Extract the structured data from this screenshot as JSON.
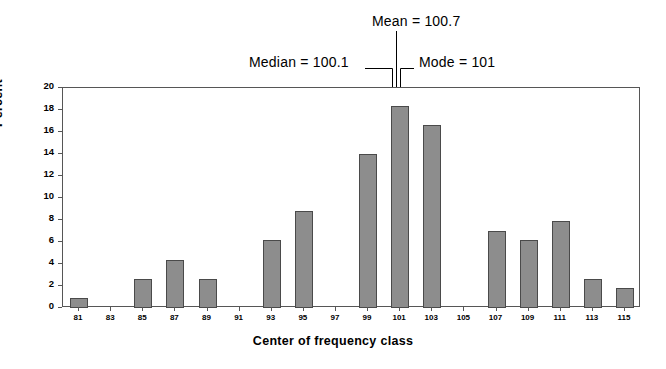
{
  "chart_data": {
    "type": "bar",
    "title": "",
    "subtitle": "",
    "xlabel": "Center of frequency class",
    "ylabel": "Percent",
    "categories": [
      81,
      82,
      83,
      84,
      85,
      86,
      87,
      88,
      89,
      90,
      91,
      92,
      93,
      94,
      95,
      96,
      97,
      98,
      99,
      100,
      101,
      102,
      103,
      104,
      105,
      106,
      107,
      108,
      109,
      110,
      111,
      112,
      113,
      114,
      115
    ],
    "values": [
      0.9,
      0,
      0,
      0,
      2.6,
      0,
      4.4,
      0,
      2.6,
      0,
      0,
      0,
      6.2,
      0,
      8.8,
      0,
      0,
      0,
      14.0,
      0,
      18.4,
      0,
      16.6,
      0,
      0,
      0,
      7.0,
      0,
      6.2,
      0,
      7.9,
      0,
      2.6,
      0,
      1.8
    ],
    "xlim": [
      80,
      116
    ],
    "ylim": [
      0,
      20
    ],
    "ytick_values": [
      0,
      2,
      4,
      6,
      8,
      10,
      12,
      14,
      16,
      18,
      20
    ],
    "ytick_labels": [
      "0",
      "2",
      "4",
      "6",
      "8",
      "10",
      "12",
      "14",
      "16",
      "18",
      "20"
    ],
    "xtick_values": [
      81,
      83,
      85,
      87,
      89,
      91,
      93,
      95,
      97,
      99,
      101,
      103,
      105,
      107,
      109,
      111,
      113,
      115
    ],
    "xtick_labels": [
      "81",
      "83",
      "85",
      "87",
      "89",
      "91",
      "93",
      "95",
      "97",
      "99",
      "101",
      "103",
      "105",
      "107",
      "109",
      "111",
      "113",
      "115"
    ],
    "grid": false,
    "legend": "none",
    "bar_color": "#8d8d8d",
    "bar_edge_color": "#4a4a4a",
    "frame_color": "#565656",
    "annotations": [
      {
        "id": "mean",
        "label": "Mean = 100.7",
        "value": 100.7,
        "anchor_x": 100.7
      },
      {
        "id": "median",
        "label": "Median = 100.1",
        "value": 100.1,
        "anchor_x": 100.1
      },
      {
        "id": "mode",
        "label": "Mode = 101",
        "value": 101,
        "anchor_x": 101
      }
    ]
  }
}
